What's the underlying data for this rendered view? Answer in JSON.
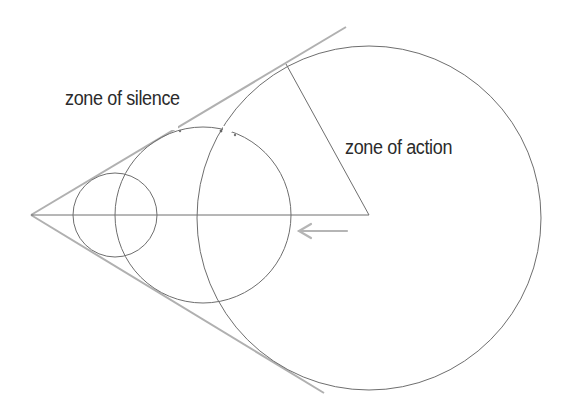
{
  "diagram": {
    "labels": {
      "silence": "zone of silence",
      "action": "zone of action"
    },
    "elements": {
      "apex": "source point",
      "axis": "horizontal axis from source to wave center",
      "circles": [
        "small wavefront",
        "medium wavefront",
        "large wavefront"
      ],
      "tangents": [
        "upper Mach cone line",
        "lower Mach cone line"
      ],
      "radius": "radius of large wavefront to tangent point",
      "arrow": "direction of motion (leftward)"
    },
    "colors": {
      "line": "#6e6e6e",
      "cone": "#b0b0b0",
      "arrow": "#b5b5b5",
      "text": "#2b2b2b"
    }
  }
}
